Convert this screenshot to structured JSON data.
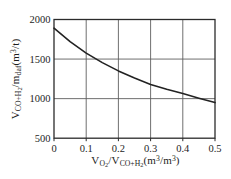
{
  "chart_data": {
    "type": "line",
    "title": "",
    "x": [
      0,
      0.05,
      0.1,
      0.15,
      0.2,
      0.25,
      0.3,
      0.35,
      0.4,
      0.45,
      0.5
    ],
    "series": [
      {
        "name": "specific CO+H2 yield vs O2 ratio",
        "values": [
          1890,
          1720,
          1575,
          1455,
          1350,
          1260,
          1180,
          1118,
          1065,
          1005,
          950
        ]
      }
    ],
    "xlim": [
      0,
      0.5
    ],
    "ylim": [
      500,
      2000
    ],
    "xticks": [
      0,
      0.1,
      0.2,
      0.3,
      0.4,
      0.5
    ],
    "xtick_labels": [
      "0",
      "0.1",
      "0.2",
      "0.3",
      "0.4",
      "0.5"
    ],
    "yticks": [
      500,
      1000,
      1500,
      2000
    ],
    "ytick_labels": [
      "500",
      "1000",
      "1500",
      "2000"
    ],
    "grid": true,
    "legend": "none",
    "xlabel_segments": [
      {
        "text": "V",
        "style": "n"
      },
      {
        "text": "O",
        "style": "sub"
      },
      {
        "text": "2",
        "style": "sub2"
      },
      {
        "text": "/V",
        "style": "n"
      },
      {
        "text": "CO+H",
        "style": "sub"
      },
      {
        "text": "2",
        "style": "sub2"
      },
      {
        "text": "(m",
        "style": "n"
      },
      {
        "text": "3",
        "style": "sup"
      },
      {
        "text": "/m",
        "style": "n"
      },
      {
        "text": "3",
        "style": "sup"
      },
      {
        "text": ")",
        "style": "n"
      }
    ],
    "ylabel_segments": [
      {
        "text": "V",
        "style": "n"
      },
      {
        "text": "CO+H",
        "style": "sub"
      },
      {
        "text": "2",
        "style": "sub2"
      },
      {
        "text": "/m",
        "style": "n"
      },
      {
        "text": "daf",
        "style": "sub"
      },
      {
        "text": "(m",
        "style": "n"
      },
      {
        "text": "3",
        "style": "sup"
      },
      {
        "text": "/t)",
        "style": "n"
      }
    ],
    "colors": {
      "curve": "#222222",
      "frame": "#2b2b2b",
      "grid": "#5f5f5f",
      "text": "#1d1d1d",
      "background": "#ffffff"
    }
  }
}
